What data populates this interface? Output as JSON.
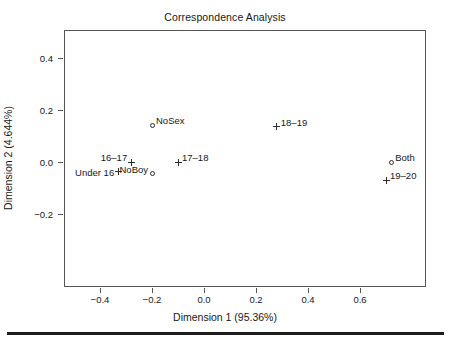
{
  "chart_data": {
    "type": "scatter",
    "title": "Correspondence Analysis",
    "xlabel": "Dimension 1 (95.36%)",
    "ylabel": "Dimension 2 (4.644%)",
    "xlim": [
      -0.5,
      0.8
    ],
    "ylim": [
      -0.32,
      0.48
    ],
    "grid": false,
    "legend": "none",
    "xticks": [
      -0.4,
      -0.2,
      0.0,
      0.2,
      0.4,
      0.6
    ],
    "xticklabels": [
      "-0.4",
      "-0.2",
      "0.0",
      "0.2",
      "0.4",
      "0.6"
    ],
    "yticks": [
      0.4,
      0.2,
      0.0,
      -0.2
    ],
    "yticklabels": [
      "0.4",
      "0.2",
      "0.0",
      "-0.2"
    ],
    "series": [
      {
        "name": "rows",
        "marker": "plus",
        "points": [
          {
            "label": "Under 16",
            "x": -0.33,
            "y": -0.038,
            "label_pos": "left"
          },
          {
            "label": "16-17",
            "x": -0.28,
            "y": 0.0,
            "label_pos": "upper-left"
          },
          {
            "label": "17-18",
            "x": -0.1,
            "y": 0.0,
            "label_pos": "upper-right"
          },
          {
            "label": "18-19",
            "x": 0.28,
            "y": 0.135,
            "label_pos": "upper-right"
          },
          {
            "label": "19-20",
            "x": 0.7,
            "y": -0.07,
            "label_pos": "upper-right"
          }
        ]
      },
      {
        "name": "columns",
        "marker": "circle",
        "points": [
          {
            "label": "NoSex",
            "x": -0.2,
            "y": 0.142,
            "label_pos": "upper-right"
          },
          {
            "label": "NoBoy",
            "x": -0.2,
            "y": -0.046,
            "label_pos": "upper-left"
          },
          {
            "label": "Both",
            "x": 0.72,
            "y": 0.0,
            "label_pos": "upper-right"
          }
        ]
      }
    ]
  },
  "axis_titles": {
    "x": "Dimension 1 (95.36%)",
    "y": "Dimension 2 (4.644%)"
  },
  "title": "Correspondence Analysis",
  "colors": {
    "marker": "#2b2b2b",
    "frame": "#555555",
    "text": "#171717",
    "rule": "#1d1d1d",
    "background": "#ffffff"
  }
}
